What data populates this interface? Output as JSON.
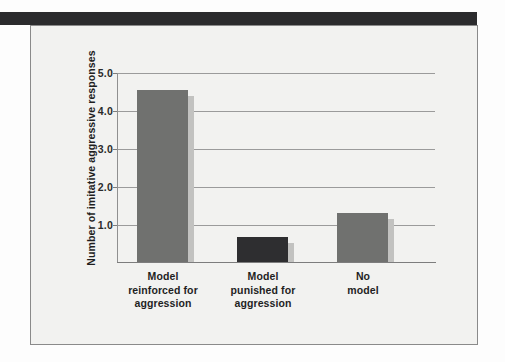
{
  "figure": {
    "panel_name": "bandura-bobo-doll-figure",
    "background_color": "#f2f2f0",
    "header_bar_color": "#2b2b2d",
    "border_color": "#8a8a8a"
  },
  "chart_data": {
    "type": "bar",
    "title": "",
    "subtitle": "",
    "xlabel": "",
    "ylabel": "Number of imitative aggressive responses",
    "categories": [
      "Model reinforced for aggression",
      "Model punished for aggression",
      "No model"
    ],
    "category_lines": [
      [
        "Model",
        "reinforced for",
        "aggression"
      ],
      [
        "Model",
        "punished for",
        "aggression"
      ],
      [
        "No",
        "model"
      ]
    ],
    "values": [
      4.55,
      0.65,
      1.3
    ],
    "ylim": [
      0,
      5.0
    ],
    "yticks": [
      1.0,
      2.0,
      3.0,
      4.0,
      5.0
    ],
    "ytick_labels": [
      "1.0",
      "2.0",
      "3.0",
      "4.0",
      "5.0"
    ],
    "grid": true,
    "grid_color": "#9b9b9b",
    "legend": null,
    "legend_position": "none",
    "bar_colors": [
      "#70716f",
      "#2e2e30",
      "#70716f"
    ],
    "bar_shadow_color": "#c2c2c0",
    "axis_color": "#7d7d7d"
  }
}
